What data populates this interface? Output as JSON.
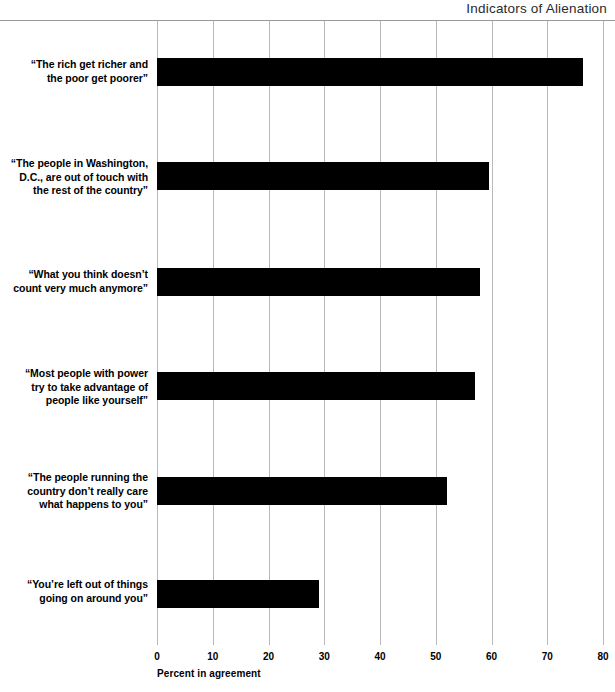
{
  "chart_data": {
    "type": "bar",
    "orientation": "horizontal",
    "title": "Indicators of Alienation",
    "xlabel": "Percent in agreement",
    "ylabel": "",
    "xlim": [
      0,
      80
    ],
    "xticks": [
      0,
      10,
      20,
      30,
      40,
      50,
      60,
      70,
      80
    ],
    "xtick_labels": [
      "0",
      "10",
      "20",
      "30",
      "40",
      "50",
      "60",
      "70",
      "80"
    ],
    "grid": true,
    "grid_axis": "x",
    "legend": false,
    "bar_color": "#000000",
    "grid_color": "#b9b9b9",
    "categories": [
      "“The rich get richer and the poor get poorer”",
      "“The people in Washington, D.C., are out of touch with the rest of the country”",
      "“What you think doesn’t count very much anymore”",
      "“Most people with power try to take advantage of people like yourself”",
      "“The people running the country don’t really care what happens to you”",
      "“You’re left out of things going on around you”"
    ],
    "category_lines": [
      [
        "“The rich get richer and",
        "the poor get poorer”"
      ],
      [
        "“The people in Washington,",
        "D.C., are out of touch with",
        "the rest of the country”"
      ],
      [
        "“What you think doesn’t",
        "count very much anymore”"
      ],
      [
        "“Most people with power",
        "try to take advantage of",
        "people like yourself”"
      ],
      [
        "“The people running the",
        "country don’t really care",
        "what happens to you”"
      ],
      [
        "“You’re left out of things",
        "going on around you”"
      ]
    ],
    "values": [
      76.5,
      59.5,
      58,
      57,
      52,
      29
    ],
    "series": [
      {
        "name": "Percent in agreement",
        "values": [
          76.5,
          59.5,
          58,
          57,
          52,
          29
        ]
      }
    ]
  }
}
